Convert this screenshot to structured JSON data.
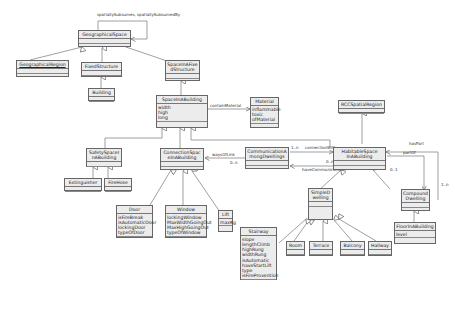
{
  "diagram": {
    "type": "UML class diagram",
    "classes": [
      {
        "id": "geographicalspace",
        "name": "GeographicalSpace",
        "attributes": []
      },
      {
        "id": "geographicalregion",
        "name": "GeographicalRegion",
        "attributes": []
      },
      {
        "id": "fixedstructure",
        "name": "FixedStructure",
        "attributes": []
      },
      {
        "id": "building",
        "name": "Building",
        "attributes": []
      },
      {
        "id": "spaceinafixedstructure",
        "name": "SpaceInAFixedStructure",
        "name_lines": [
          "SpaceInAFixe",
          "dStructure"
        ],
        "attributes": []
      },
      {
        "id": "spaceinabuilding",
        "name": "SpaceInABuilding",
        "attributes": [
          "width",
          "high",
          "long"
        ]
      },
      {
        "id": "material",
        "name": "Material",
        "attributes": [
          "inflammable",
          "toxic",
          "ofMaterial"
        ]
      },
      {
        "id": "rccspatialregion",
        "name": "RCCSpatialRegion",
        "attributes": []
      },
      {
        "id": "safetyspaceinabuilding",
        "name": "SafetySpaceInABuilding",
        "name_lines": [
          "SafetySpaceI",
          "nABuilding"
        ],
        "attributes": []
      },
      {
        "id": "extinguisher",
        "name": "Extinguisher",
        "attributes": []
      },
      {
        "id": "firehose",
        "name": "FireHose",
        "attributes": []
      },
      {
        "id": "connectionspaceinabuilding",
        "name": "ConnectionSpaceInABuilding",
        "name_lines": [
          "ConnectionSpac",
          "eInABuilding"
        ],
        "attributes": []
      },
      {
        "id": "communicationamongdwellings",
        "name": "CommunicationAmongDwellings",
        "name_lines": [
          "CommunicationA",
          "mongDwellings"
        ],
        "attributes": []
      },
      {
        "id": "habitablespaceinabuilding",
        "name": "HabitableSpaceInABuilding",
        "name_lines": [
          "HabitableSpace",
          "InABuilding"
        ],
        "attributes": []
      },
      {
        "id": "door",
        "name": "Door",
        "attributes": [
          "isFireBreak",
          "isAutomaticDoor",
          "lockingDoor",
          "typeOfDoor"
        ]
      },
      {
        "id": "window",
        "name": "Window",
        "attributes": [
          "lockingWindow",
          "MaxWidthGoingOut",
          "MaxHighGoingOut",
          "typeOfWindow"
        ]
      },
      {
        "id": "lift",
        "name": "Lift",
        "attributes": [
          "maxKg"
        ]
      },
      {
        "id": "stairway",
        "name": "Stairway",
        "attributes": [
          "slope",
          "lengthClimb",
          "highRung",
          "widthRung",
          "isAutomatic",
          "haveStartLift",
          "type",
          "isFireProvention"
        ]
      },
      {
        "id": "simpledwelling",
        "name": "SimpleDwelling",
        "name_lines": [
          "SimpleD",
          "welling"
        ],
        "attributes": []
      },
      {
        "id": "room",
        "name": "Room",
        "attributes": []
      },
      {
        "id": "terrace",
        "name": "Terrace",
        "attributes": []
      },
      {
        "id": "balcony",
        "name": "Balcony",
        "attributes": []
      },
      {
        "id": "hallway",
        "name": "Hallway",
        "attributes": []
      },
      {
        "id": "compounddwelling",
        "name": "CompoundDwelling",
        "name_lines": [
          "Compound",
          "Dwelling"
        ],
        "attributes": []
      },
      {
        "id": "floorinabuilding",
        "name": "FloorInABuilding",
        "attributes": [
          "level"
        ]
      }
    ],
    "association_labels": {
      "self_assoc": "spatiallySubsumes, spatiallySubsumedBy",
      "contain_material": "containMaterial",
      "connection_with": "connectionWith",
      "connection_with_mult_left": "1..n",
      "have_communication": "haveCommunication",
      "have_communication_mult": "0..n",
      "ways_of_link": "waysOfLink",
      "ways_of_link_mult": "0..n",
      "has_part": "hasPart",
      "part_of": "partOf",
      "part_mult_a": "0..1",
      "part_mult_b": "1..n"
    },
    "colors": {
      "box_fill": "#ececec",
      "border": "#666666",
      "line": "#777777",
      "background": "#ffffff"
    }
  }
}
